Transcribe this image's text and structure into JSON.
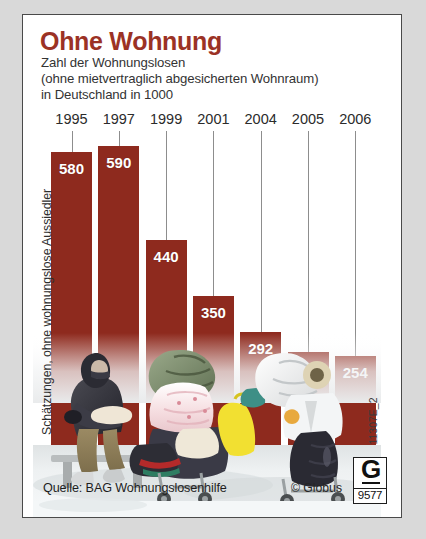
{
  "header": {
    "title": "Ohne Wohnung",
    "subtitle_line1": "Zahl der Wohnungslosen",
    "subtitle_line2": "(ohne mietvertraglich abgesicherten Wohnraum)",
    "subtitle_line3": "in Deutschland in 1000",
    "title_color": "#9b3225"
  },
  "chart_data": {
    "type": "bar",
    "title": "Ohne Wohnung",
    "subtitle": "Zahl der Wohnungslosen (ohne mietvertraglich abgesicherten Wohnraum) in Deutschland in 1000",
    "xlabel": "",
    "ylabel": "in 1000",
    "categories": [
      "1995",
      "1997",
      "1999",
      "2001",
      "2004",
      "2005",
      "2006"
    ],
    "values": [
      580,
      590,
      440,
      350,
      292,
      261,
      254
    ],
    "value_labels": [
      "580",
      "590",
      "440",
      "350",
      "292",
      "261",
      "254"
    ],
    "ylim": [
      0,
      590
    ],
    "grid": false,
    "legend": null,
    "bar_color": "#8e2a1e",
    "label_color": "#ffffff"
  },
  "annotations": {
    "left_note": "Schätzungen, ohne wohnungslose Aussiedler",
    "right_code": "11307E_2",
    "source": "Quelle: BAG Wohnungslosenhilfe",
    "copyright": "© Globus"
  },
  "logo": {
    "letter": "G",
    "number": "9577"
  },
  "photo": {
    "alt": "Wohnungslose Menschen mit Einkaufswagen voller Habseligkeiten auf einer Bank im Schnee"
  }
}
